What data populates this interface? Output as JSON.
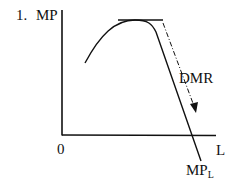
{
  "diagram": {
    "number_label": "1.",
    "y_axis_label": "MP",
    "x_axis_label": "L",
    "origin_label": "0",
    "curve_label_main": "MP",
    "curve_label_sub": "L",
    "annotation_label": "DMR",
    "colors": {
      "line": "#111111",
      "background": "#ffffff"
    }
  }
}
